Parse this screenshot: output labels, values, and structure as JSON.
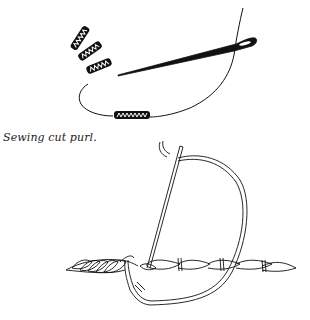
{
  "figure": {
    "caption": "Sewing cut purl.",
    "top_illustration": {
      "description": "Needle threaded with cut purl pieces",
      "elements": [
        "needle",
        "thread",
        "loose-purl-pieces",
        "threaded-purl-piece"
      ],
      "loose_purl_count": 3
    },
    "bottom_illustration": {
      "description": "Needle stitching purl over twisted cord",
      "elements": [
        "needle",
        "thread-loop",
        "twisted-cord",
        "couching-stitches"
      ],
      "couching_stitch_count": 3
    },
    "colors": {
      "ink": "#111111",
      "background": "#ffffff"
    }
  }
}
